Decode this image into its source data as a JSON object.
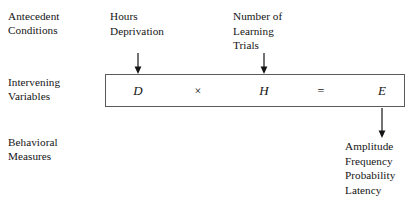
{
  "diagram": {
    "row_labels": [
      {
        "id": "antecedent-conditions",
        "text": "Antecedent\nConditions"
      },
      {
        "id": "intervening-variables",
        "text": "Intervening\nVariables"
      },
      {
        "id": "behavioral-measures",
        "text": "Behavioral\nMeasures"
      }
    ],
    "inputs": [
      {
        "id": "hours-deprivation",
        "text": "Hours\nDeprivation"
      },
      {
        "id": "number-of-learning-trials",
        "text": "Number of\nLearning\nTrials"
      }
    ],
    "equation": {
      "term_d": "D",
      "operator_times": "×",
      "term_h": "H",
      "operator_equals": "=",
      "term_e": "E"
    },
    "outputs": {
      "items": [
        "Amplitude",
        "Frequency",
        "Probability",
        "Latency"
      ]
    },
    "arrows": [
      {
        "id": "arrow-to-d",
        "direction": "down"
      },
      {
        "id": "arrow-to-h",
        "direction": "down"
      },
      {
        "id": "arrow-from-e",
        "direction": "down"
      }
    ],
    "colors": {
      "ink": "#141414",
      "box_border": "#5a5a5a",
      "background": "#ffffff"
    }
  }
}
